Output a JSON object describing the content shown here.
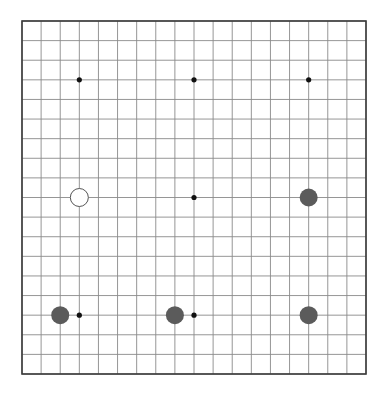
{
  "game": {
    "type": "go",
    "board_size": 19,
    "star_points": [
      [
        3,
        3
      ],
      [
        9,
        3
      ],
      [
        15,
        3
      ],
      [
        3,
        9
      ],
      [
        9,
        9
      ],
      [
        15,
        9
      ],
      [
        3,
        15
      ],
      [
        9,
        15
      ],
      [
        15,
        15
      ]
    ],
    "stones": [
      {
        "color": "white",
        "col": 3,
        "row": 9
      },
      {
        "color": "black",
        "col": 15,
        "row": 9
      },
      {
        "color": "black",
        "col": 2,
        "row": 15
      },
      {
        "color": "black",
        "col": 8,
        "row": 15
      },
      {
        "color": "black",
        "col": 15,
        "row": 15
      }
    ]
  },
  "colors": {
    "background": "#ffffff",
    "grid_line": "#8a8a8a",
    "border": "#3a3a3a",
    "star_point": "#111111",
    "black_stone": "#5b5b5b",
    "white_stone": "#ffffff",
    "white_stone_outline": "#555555"
  }
}
